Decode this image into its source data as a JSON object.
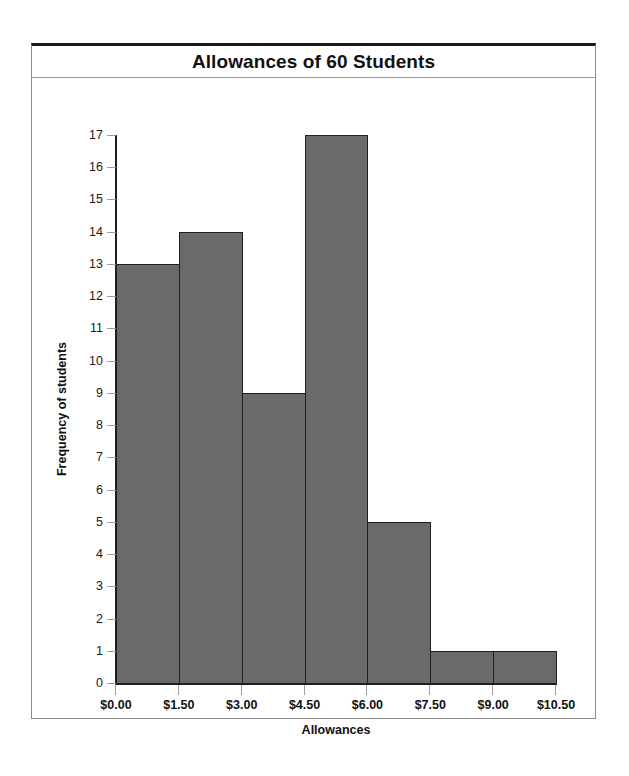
{
  "chart_data": {
    "type": "bar",
    "title": "Allowances of 60 Students",
    "xlabel": "Allowances",
    "ylabel": "Frequency of students",
    "categories": [
      "$0.00-$1.50",
      "$1.50-$3.00",
      "$3.00-$4.50",
      "$4.50-$6.00",
      "$6.00-$7.50",
      "$7.50-$9.00",
      "$9.00-$10.50"
    ],
    "values": [
      13,
      14,
      9,
      17,
      5,
      1,
      1
    ],
    "bin_edges": [
      0.0,
      1.5,
      3.0,
      4.5,
      6.0,
      7.5,
      9.0,
      10.5
    ],
    "xtick_labels": [
      "$0.00",
      "$1.50",
      "$3.00",
      "$4.50",
      "$6.00",
      "$7.50",
      "$9.00",
      "$10.50"
    ],
    "ytick_labels": [
      "0",
      "1",
      "2",
      "3",
      "4",
      "5",
      "6",
      "7",
      "8",
      "9",
      "10",
      "11",
      "12",
      "13",
      "14",
      "15",
      "16",
      "17"
    ],
    "ylim": [
      0,
      17
    ],
    "xlim": [
      0.0,
      10.5
    ],
    "grid": false,
    "legend": false,
    "bar_color": "#6a6a6a",
    "bar_edge_color": "#1f1f1f",
    "axis_color": "#1f1f1f",
    "tick_color": "#9d9d9d",
    "total_observations": 60
  }
}
